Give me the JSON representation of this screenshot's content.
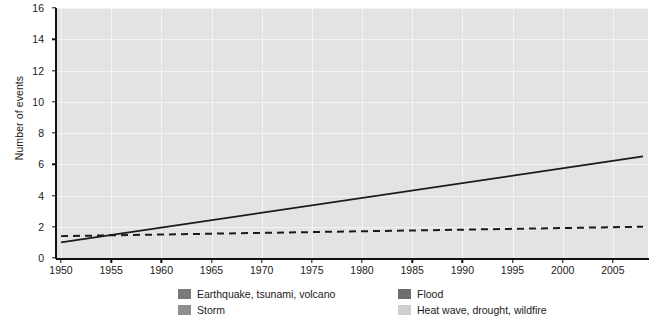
{
  "chart_data": {
    "type": "bar",
    "title": "",
    "xlabel": "",
    "ylabel": "Number of events",
    "ylim": [
      0,
      16
    ],
    "xlim": [
      1950,
      2008
    ],
    "ytick_values": [
      0,
      2,
      4,
      6,
      8,
      10,
      12,
      14,
      16
    ],
    "xtick_values": [
      1950,
      1955,
      1960,
      1965,
      1970,
      1975,
      1980,
      1985,
      1990,
      1995,
      2000,
      2005
    ],
    "stacked": true,
    "grid": true,
    "legend_position": "bottom",
    "categories": [
      1950,
      1951,
      1952,
      1953,
      1954,
      1955,
      1956,
      1957,
      1958,
      1959,
      1960,
      1961,
      1962,
      1963,
      1964,
      1965,
      1966,
      1967,
      1968,
      1969,
      1970,
      1971,
      1972,
      1973,
      1974,
      1975,
      1976,
      1977,
      1978,
      1979,
      1980,
      1981,
      1982,
      1983,
      1984,
      1985,
      1986,
      1987,
      1988,
      1989,
      1990,
      1991,
      1992,
      1993,
      1994,
      1995,
      1996,
      1997,
      1998,
      1999,
      2000,
      2001,
      2002,
      2003,
      2004,
      2005,
      2006,
      2007,
      2008
    ],
    "series": [
      {
        "name": "Earthquake, tsunami, volcano",
        "color": "#7a7a7a",
        "values": [
          1,
          2,
          0,
          0,
          0,
          1,
          1,
          1,
          1,
          1,
          1,
          1,
          1,
          1,
          1,
          1,
          1,
          1,
          1,
          1,
          1,
          1,
          1,
          1,
          1,
          2,
          1,
          2,
          1,
          1,
          1,
          1,
          1,
          1,
          1,
          1,
          1,
          2,
          1,
          1,
          1,
          1,
          1,
          2,
          1,
          1,
          1,
          1,
          1,
          1,
          1,
          2,
          1,
          1,
          1,
          1,
          1,
          1,
          1
        ]
      },
      {
        "name": "Storm",
        "color": "#8f8f8f",
        "values": [
          0,
          3,
          0,
          0,
          0,
          1,
          1,
          1,
          0,
          1,
          3,
          1,
          1,
          2,
          2,
          1,
          1,
          1,
          1,
          1,
          2,
          2,
          1,
          3,
          2,
          1,
          2,
          8,
          1,
          2,
          1,
          2,
          4,
          1,
          1,
          2,
          3,
          5,
          9,
          3,
          5,
          4,
          3,
          11,
          2,
          10,
          3,
          2,
          3,
          9,
          2,
          1,
          2,
          4,
          2,
          7,
          2,
          4,
          3
        ]
      },
      {
        "name": "Flood",
        "color": "#6f6f6f",
        "values": [
          0,
          0,
          0,
          0,
          0,
          0,
          0,
          0,
          0,
          0,
          0,
          0,
          0,
          0,
          0,
          0,
          0,
          0,
          0,
          0,
          0,
          0,
          1,
          0,
          1,
          1,
          0,
          0,
          0,
          0,
          0,
          1,
          1,
          1,
          0,
          1,
          1,
          1,
          1,
          1,
          2,
          1,
          2,
          1,
          1,
          1,
          2,
          1,
          1,
          1,
          0,
          1,
          1,
          1,
          1,
          1,
          1,
          0,
          0
        ]
      },
      {
        "name": "Heat wave, drought, wildfire",
        "color": "#cfcfcf",
        "values": [
          0,
          0,
          0,
          0,
          0,
          0,
          0,
          0,
          0,
          0,
          0,
          0,
          0,
          0,
          0,
          0,
          0,
          0,
          0,
          0,
          0,
          0,
          0,
          0,
          0,
          0,
          0,
          0,
          1,
          0,
          0,
          1,
          1,
          0,
          0,
          2,
          2,
          3,
          1,
          1,
          1,
          2,
          1,
          1,
          1,
          0,
          1,
          0,
          1,
          2,
          0,
          0,
          0,
          0,
          2,
          3,
          1,
          0,
          0
        ]
      }
    ],
    "annotations": [
      {
        "name": "trend-line-solid",
        "style": "solid",
        "color": "#1a1a1a",
        "x0": 1950,
        "y0": 1.0,
        "x1": 2008,
        "y1": 6.5
      },
      {
        "name": "trend-line-dashed",
        "style": "dashed",
        "color": "#1a1a1a",
        "x0": 1950,
        "y0": 1.4,
        "x1": 2008,
        "y1": 2.0
      }
    ]
  },
  "legend": {
    "items": [
      {
        "label": "Earthquake, tsunami, volcano",
        "color": "#7a7a7a"
      },
      {
        "label": "Flood",
        "color": "#6f6f6f"
      },
      {
        "label": "Storm",
        "color": "#8f8f8f"
      },
      {
        "label": "Heat wave, drought, wildfire",
        "color": "#cfcfcf"
      }
    ]
  }
}
